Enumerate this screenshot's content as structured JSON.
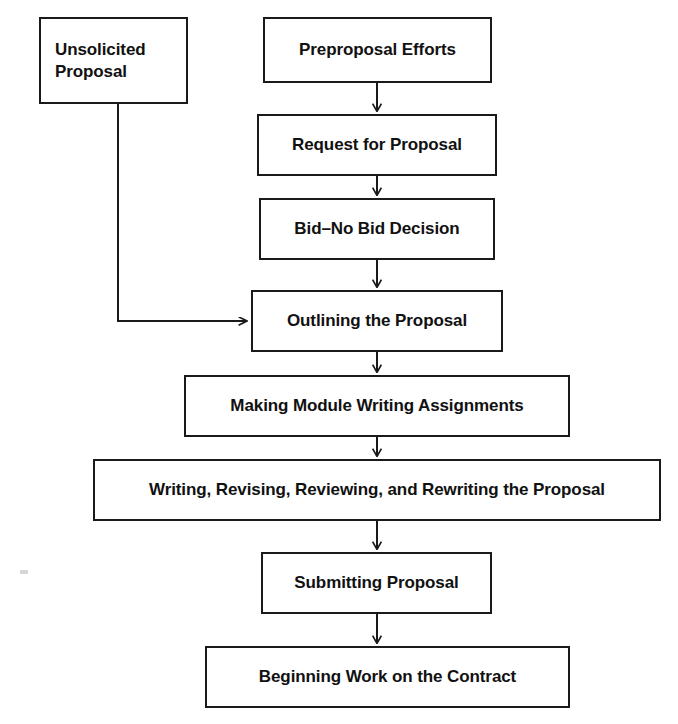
{
  "diagram": {
    "background_color": "#ffffff",
    "line_color": "#1a1a1a",
    "text_color": "#111111"
  },
  "nodes": {
    "unsolicited_proposal": {
      "label": "Unsolicited\nProposal",
      "x": 39,
      "y": 17,
      "w": 149,
      "h": 87,
      "align": "left"
    },
    "preproposal_efforts": {
      "label": "Preproposal Efforts",
      "x": 263,
      "y": 17,
      "w": 229,
      "h": 66,
      "align": "center"
    },
    "request_for_proposal": {
      "label": "Request for Proposal",
      "x": 257,
      "y": 114,
      "w": 240,
      "h": 62,
      "align": "center"
    },
    "bid_no_bid_decision": {
      "label": "Bid–No Bid Decision",
      "x": 259,
      "y": 198,
      "w": 236,
      "h": 62,
      "align": "center"
    },
    "outlining_the_proposal": {
      "label": "Outlining the Proposal",
      "x": 251,
      "y": 290,
      "w": 252,
      "h": 62,
      "align": "center"
    },
    "making_module_writing_assignments": {
      "label": "Making Module Writing Assignments",
      "x": 184,
      "y": 375,
      "w": 386,
      "h": 62,
      "align": "center"
    },
    "writing_revising_reviewing_rewriting": {
      "label": "Writing, Revising, Reviewing, and Rewriting the Proposal",
      "x": 93,
      "y": 459,
      "w": 568,
      "h": 62,
      "align": "center"
    },
    "submitting_proposal": {
      "label": "Submitting Proposal",
      "x": 261,
      "y": 552,
      "w": 231,
      "h": 62,
      "align": "center"
    },
    "beginning_work_on_the_contract": {
      "label": "Beginning Work on the Contract",
      "x": 205,
      "y": 646,
      "w": 365,
      "h": 62,
      "align": "center"
    }
  },
  "edges": [
    {
      "name": "preproposal-to-request",
      "from": "preproposal_efforts",
      "to": "request_for_proposal",
      "type": "straight-down",
      "path": "M 377 83 L 377 112",
      "arrow": "down"
    },
    {
      "name": "request-to-bid",
      "from": "request_for_proposal",
      "to": "bid_no_bid_decision",
      "type": "straight-down",
      "path": "M 377 176 L 377 196",
      "arrow": "down"
    },
    {
      "name": "bid-to-outlining",
      "from": "bid_no_bid_decision",
      "to": "outlining_the_proposal",
      "type": "straight-down",
      "path": "M 377 260 L 377 288",
      "arrow": "down"
    },
    {
      "name": "unsolicited-to-outlining",
      "from": "unsolicited_proposal",
      "to": "outlining_the_proposal",
      "type": "elbow-right",
      "path": "M 118 104 L 118 321 L 249 321",
      "arrow": "right"
    },
    {
      "name": "outlining-to-making-module",
      "from": "outlining_the_proposal",
      "to": "making_module_writing_assignments",
      "type": "straight-down",
      "path": "M 377 352 L 377 373",
      "arrow": "down"
    },
    {
      "name": "making-module-to-writing",
      "from": "making_module_writing_assignments",
      "to": "writing_revising_reviewing_rewriting",
      "type": "straight-down",
      "path": "M 377 437 L 377 457",
      "arrow": "down"
    },
    {
      "name": "writing-to-submitting",
      "from": "writing_revising_reviewing_rewriting",
      "to": "submitting_proposal",
      "type": "straight-down",
      "path": "M 377 521 L 377 550",
      "arrow": "down"
    },
    {
      "name": "submitting-to-beginning-work",
      "from": "submitting_proposal",
      "to": "beginning_work_on_the_contract",
      "type": "straight-down",
      "path": "M 377 614 L 377 644",
      "arrow": "down"
    }
  ]
}
